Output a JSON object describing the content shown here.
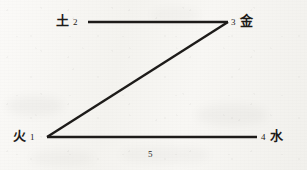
{
  "figure": {
    "kind": "line-diagram",
    "shape_name": "z-path",
    "background_color": "#f6f5f2",
    "ink_color": "#1d1b19"
  },
  "nodes": [
    {
      "id": "earth",
      "index": "2",
      "character": "土",
      "position": "top-left",
      "point": {
        "x": 88,
        "y": 22
      }
    },
    {
      "id": "metal",
      "index": "3",
      "character": "金",
      "position": "top-right",
      "point": {
        "x": 228,
        "y": 22
      }
    },
    {
      "id": "fire",
      "index": "1",
      "character": "火",
      "position": "bottom-left",
      "point": {
        "x": 47,
        "y": 137
      }
    },
    {
      "id": "water",
      "index": "4",
      "character": "水",
      "position": "bottom-right",
      "point": {
        "x": 257,
        "y": 137
      }
    }
  ],
  "edges": [
    {
      "id": "edge-top",
      "from": "earth",
      "to": "metal",
      "label": "",
      "x1": 88,
      "y1": 22,
      "x2": 228,
      "y2": 22
    },
    {
      "id": "edge-diagonal",
      "from": "metal",
      "to": "fire",
      "label": "",
      "x1": 228,
      "y1": 22,
      "x2": 47,
      "y2": 137
    },
    {
      "id": "edge-bottom",
      "from": "fire",
      "to": "water",
      "label": "5",
      "x1": 47,
      "y1": 137,
      "x2": 257,
      "y2": 137
    }
  ],
  "edge_labels": {
    "bottom": "5"
  }
}
